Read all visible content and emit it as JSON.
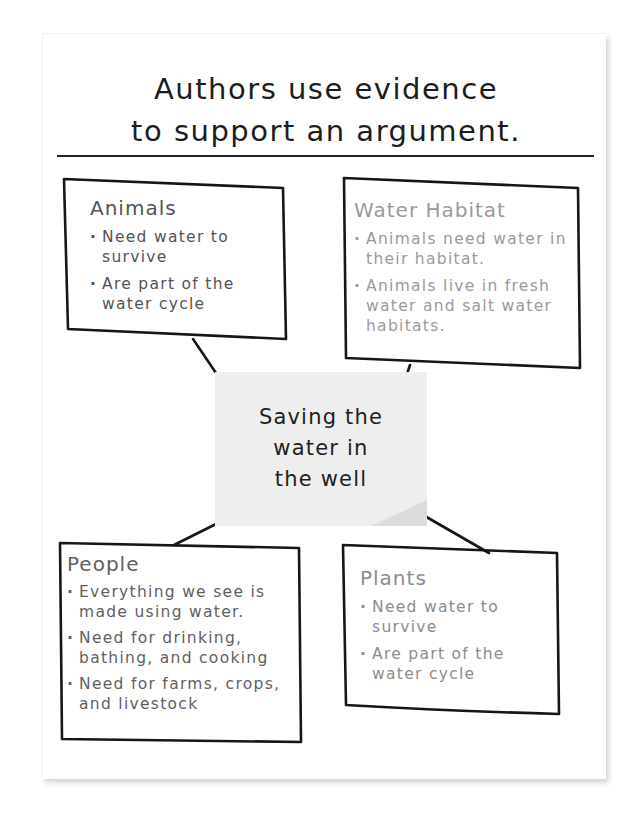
{
  "poster": {
    "title_line1": "Authors use evidence",
    "title_line2": "to support an argument."
  },
  "center_note": {
    "line1": "Saving the",
    "line2": "water in",
    "line3": "the well"
  },
  "boxes": {
    "animals": {
      "heading": "Animals",
      "items": [
        "Need water to survive",
        "Are part of the water cycle"
      ],
      "color": "#545454"
    },
    "water_habitat": {
      "heading": "Water Habitat",
      "items": [
        "Animals need water in their habitat.",
        "Animals live in fresh water and salt water habitats."
      ],
      "color": "#9a9a9a"
    },
    "people": {
      "heading": "People",
      "items": [
        "Everything we see is made using water.",
        "Need for drinking, bathing, and cooking",
        "Need for farms, crops, and livestock"
      ],
      "color": "#5f5f5f"
    },
    "plants": {
      "heading": "Plants",
      "items": [
        "Need water to survive",
        "Are part of the water cycle"
      ],
      "color": "#8c8c8c"
    }
  }
}
